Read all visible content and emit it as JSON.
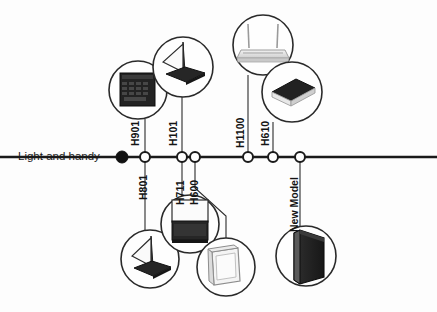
{
  "diagram": {
    "type": "product-evolution-timeline",
    "start_label": "Light and handy",
    "axis": {
      "y": 157,
      "x_start": 0,
      "x_end": 437,
      "origin_marker": "filled-dot",
      "origin_x": 122
    },
    "nodes": [
      {
        "id": "H901",
        "label": "H901",
        "x": 145,
        "label_side": "above",
        "label_x": 129,
        "label_y": 146,
        "bubble": {
          "cx": 138,
          "cy": 90,
          "r": 29,
          "device": "dark-keyboard-unit",
          "tone": "dark"
        },
        "connector": [
          [
            145,
            152
          ],
          [
            145,
            119
          ]
        ]
      },
      {
        "id": "H801",
        "label": "H801",
        "x": 145,
        "label_side": "below",
        "label_x": 137,
        "label_y": 200,
        "bubble": {
          "cx": 150,
          "cy": 259,
          "r": 29,
          "device": "open-laptop",
          "tone": "dark"
        },
        "connector": [
          [
            145,
            162
          ],
          [
            145,
            230
          ]
        ]
      },
      {
        "id": "H101",
        "label": "H101",
        "x": 182,
        "label_side": "above",
        "label_x": 167,
        "label_y": 146,
        "bubble": {
          "cx": 183,
          "cy": 67,
          "r": 30,
          "device": "open-laptop",
          "tone": "dark"
        },
        "connector": [
          [
            182,
            152
          ],
          [
            182,
            97
          ]
        ]
      },
      {
        "id": "H711",
        "label": "H711",
        "x": 182,
        "label_side": "below",
        "label_x": 174,
        "label_y": 205,
        "bubble": {
          "cx": 190,
          "cy": 224,
          "r": 29,
          "device": "monitor",
          "tone": "dark"
        },
        "connector": [
          [
            182,
            162
          ],
          [
            182,
            195
          ]
        ]
      },
      {
        "id": "H600",
        "label": "H600",
        "x": 195,
        "label_side": "below",
        "label_x": 188,
        "label_y": 205,
        "bubble": {
          "cx": 226,
          "cy": 267,
          "r": 29,
          "device": "white-box-unit",
          "tone": "light"
        },
        "connector": [
          [
            195,
            162
          ],
          [
            195,
            188
          ],
          [
            226,
            215
          ],
          [
            226,
            238
          ]
        ]
      },
      {
        "id": "H1100",
        "label": "H1100",
        "x": 248,
        "label_side": "above",
        "label_x": 234,
        "label_y": 148,
        "bubble": {
          "cx": 263,
          "cy": 45,
          "r": 30,
          "device": "router-with-antennas",
          "tone": "light"
        },
        "connector": [
          [
            248,
            152
          ],
          [
            248,
            75
          ]
        ]
      },
      {
        "id": "H610",
        "label": "H610",
        "x": 273,
        "label_side": "above",
        "label_x": 259,
        "label_y": 146,
        "bubble": {
          "cx": 292,
          "cy": 92,
          "r": 30,
          "device": "closed-laptop",
          "tone": "dark"
        },
        "connector": [
          [
            273,
            152
          ],
          [
            273,
            128
          ]
        ]
      },
      {
        "id": "NewModel",
        "label": "New Model",
        "x": 300,
        "label_side": "below",
        "label_x": 288,
        "label_y": 230,
        "bubble": {
          "cx": 306,
          "cy": 256,
          "r": 30,
          "device": "standing-laptop-slab",
          "tone": "dark"
        },
        "connector": [
          [
            300,
            162
          ],
          [
            300,
            226
          ]
        ]
      }
    ],
    "colors": {
      "line": "#1a1a1a",
      "node_fill": "#ffffff",
      "node_stroke": "#1a1a1a",
      "origin_fill": "#111111",
      "bubble_stroke": "#2a2a2a",
      "dark_device": "#262626",
      "light_device": "#d9d9d9",
      "text": "#141414",
      "background": "#fdfdfd"
    }
  },
  "artifacts": {
    "bleed_texts": [
      "Light and handy",
      "New Model",
      "H1100"
    ]
  }
}
